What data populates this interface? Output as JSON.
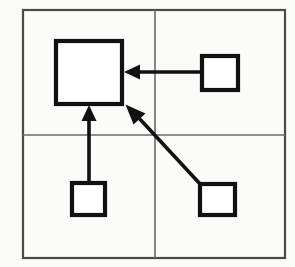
{
  "figure": {
    "canvas": {
      "width": 295,
      "height": 267
    },
    "background_color": "#fbfbfa",
    "frame": {
      "label": "outer frame",
      "stroke_color": "#4a4a4a",
      "x": 23,
      "y": 10,
      "width": 262,
      "height": 248
    },
    "dividers": {
      "label": "quadrant dividers",
      "stroke_color": "#6a6a6a",
      "vertical_x": 155,
      "horizontal_y": 135
    },
    "quadrants": [
      {
        "name": "top-left",
        "contains": "large-square"
      },
      {
        "name": "top-right",
        "contains": "small-square-top-right"
      },
      {
        "name": "bottom-left",
        "contains": "small-square-bottom-left"
      },
      {
        "name": "bottom-right",
        "contains": "small-square-bottom-right"
      }
    ],
    "nodes": [
      {
        "id": "large-square",
        "label": "",
        "size": "large",
        "quadrant": "top-left",
        "x": 56,
        "y": 41,
        "width": 66,
        "height": 63,
        "stroke_color": "#111111",
        "fill_color": "#ffffff"
      },
      {
        "id": "small-square-top-right",
        "label": "",
        "size": "small",
        "quadrant": "top-right",
        "x": 202,
        "y": 56,
        "width": 36,
        "height": 34,
        "stroke_color": "#111111",
        "fill_color": "#ffffff"
      },
      {
        "id": "small-square-bottom-left",
        "label": "",
        "size": "small",
        "quadrant": "bottom-left",
        "x": 72,
        "y": 183,
        "width": 33,
        "height": 32,
        "stroke_color": "#111111",
        "fill_color": "#ffffff"
      },
      {
        "id": "small-square-bottom-right",
        "label": "",
        "size": "small",
        "quadrant": "bottom-right",
        "x": 200,
        "y": 184,
        "width": 35,
        "height": 31,
        "stroke_color": "#111111",
        "fill_color": "#ffffff"
      }
    ],
    "arrows": [
      {
        "id": "arrow-right-to-large",
        "from": "small-square-top-right",
        "to": "large-square",
        "direction": "leftward-horizontal",
        "shaft": {
          "x1": 202,
          "y1": 72,
          "x2": 137,
          "y2": 72
        },
        "head": {
          "points": "124,72 139,65 139,79",
          "tip_x": 124,
          "tip_y": 72
        },
        "color": "#111111"
      },
      {
        "id": "arrow-bottom-left-to-large",
        "from": "small-square-bottom-left",
        "to": "large-square",
        "direction": "upward-vertical",
        "shaft": {
          "x1": 89,
          "y1": 183,
          "x2": 89,
          "y2": 120
        },
        "head": {
          "points": "89,106 82,121 96,121",
          "tip_x": 89,
          "tip_y": 106
        },
        "color": "#111111"
      },
      {
        "id": "arrow-bottom-right-to-large",
        "from": "small-square-bottom-right",
        "to": "large-square",
        "direction": "diagonal-up-left",
        "shaft": {
          "x1": 201,
          "y1": 185,
          "x2": 138,
          "y2": 117
        },
        "head": {
          "points": "126,105 144,113 133,123",
          "tip_x": 126,
          "tip_y": 105
        },
        "color": "#111111"
      }
    ]
  }
}
